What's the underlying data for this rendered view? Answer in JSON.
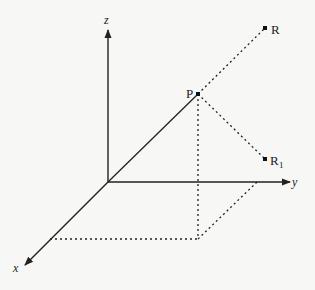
{
  "diagram": {
    "type": "3d-coordinate-axes",
    "axes": {
      "x": {
        "label": "x"
      },
      "y": {
        "label": "y"
      },
      "z": {
        "label": "z"
      }
    },
    "points": {
      "P": {
        "label": "P"
      },
      "R": {
        "label": "R"
      },
      "R1": {
        "label": "R",
        "subscript": "1"
      }
    },
    "colors": {
      "line": "#222222",
      "background": "#f7f7f5"
    }
  }
}
